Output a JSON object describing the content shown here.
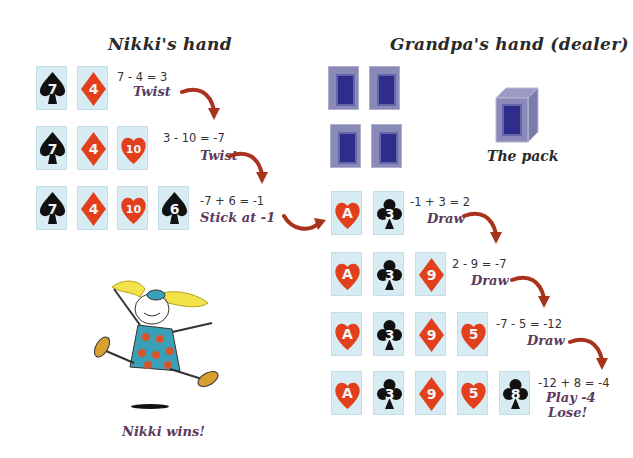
{
  "titles": {
    "left": "Nikki's hand",
    "right": "Grandpa's hand (dealer)",
    "pack": "The pack",
    "winner": "Nikki wins!"
  },
  "colors": {
    "card_face": "#d6ebf2",
    "red_suit": "#e2401c",
    "black_suit": "#111111",
    "card_back": "#8a8ab8",
    "card_back_inner": "#2e2e8a",
    "arrow": "#a8321c",
    "action_text": "#5a3a5e"
  },
  "nikki": {
    "rows": [
      {
        "cards": [
          {
            "rank": "7",
            "suit": "spade"
          },
          {
            "rank": "4",
            "suit": "diamond"
          }
        ],
        "calc": "7 - 4 = 3",
        "action": "Twist"
      },
      {
        "cards": [
          {
            "rank": "7",
            "suit": "spade"
          },
          {
            "rank": "4",
            "suit": "diamond"
          },
          {
            "rank": "10",
            "suit": "heart"
          }
        ],
        "calc": "3 - 10 = -7",
        "action": "Twist"
      },
      {
        "cards": [
          {
            "rank": "7",
            "suit": "spade"
          },
          {
            "rank": "4",
            "suit": "diamond"
          },
          {
            "rank": "10",
            "suit": "heart"
          },
          {
            "rank": "6",
            "suit": "spade"
          }
        ],
        "calc": "-7 + 6 = -1",
        "action": "Stick at -1"
      }
    ]
  },
  "grandpa": {
    "face_down_cards": 4,
    "rows": [
      {
        "cards": [
          {
            "rank": "A",
            "suit": "heart"
          },
          {
            "rank": "3",
            "suit": "club"
          }
        ],
        "calc": "-1 + 3 = 2",
        "action": "Draw"
      },
      {
        "cards": [
          {
            "rank": "A",
            "suit": "heart"
          },
          {
            "rank": "3",
            "suit": "club"
          },
          {
            "rank": "9",
            "suit": "diamond"
          }
        ],
        "calc": "2 - 9 = -7",
        "action": "Draw"
      },
      {
        "cards": [
          {
            "rank": "A",
            "suit": "heart"
          },
          {
            "rank": "3",
            "suit": "club"
          },
          {
            "rank": "9",
            "suit": "diamond"
          },
          {
            "rank": "5",
            "suit": "heart"
          }
        ],
        "calc": "-7 - 5 = -12",
        "action": "Draw"
      },
      {
        "cards": [
          {
            "rank": "A",
            "suit": "heart"
          },
          {
            "rank": "3",
            "suit": "club"
          },
          {
            "rank": "9",
            "suit": "diamond"
          },
          {
            "rank": "5",
            "suit": "heart"
          },
          {
            "rank": "8",
            "suit": "club"
          }
        ],
        "calc": "-12 + 8 = -4",
        "action": "Play -4",
        "action2": "Lose!"
      }
    ]
  }
}
